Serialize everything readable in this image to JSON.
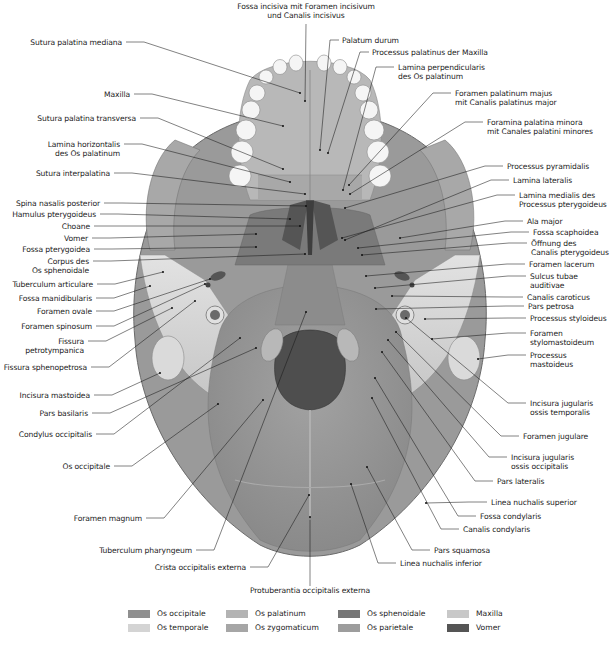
{
  "diagram": {
    "labels_left": [
      {
        "id": "sutura-palatina-mediana",
        "text": "Sutura palatina mediana",
        "x": 122,
        "y": 42,
        "ax": 300,
        "ay": 93
      },
      {
        "id": "maxilla",
        "text": "Maxilla",
        "x": 130,
        "y": 94,
        "ax": 283,
        "ay": 126
      },
      {
        "id": "sutura-palatina-transversa",
        "text": "Sutura palatina transversa",
        "x": 136,
        "y": 118,
        "ax": 283,
        "ay": 169
      },
      {
        "id": "lamina-horizontalis",
        "text": "Lamina horizontalis\ndes Os palatinum",
        "x": 120,
        "y": 144,
        "ax": 290,
        "ay": 182
      },
      {
        "id": "sutura-interpalatina",
        "text": "Sutura interpalatina",
        "x": 110,
        "y": 173,
        "ax": 305,
        "ay": 194
      },
      {
        "id": "spina-nasalis-posterior",
        "text": "Spina nasalis posterior",
        "x": 100,
        "y": 203,
        "ax": 306,
        "ay": 206
      },
      {
        "id": "hamulus-pterygoideus",
        "text": "Hamulus pterygoideus",
        "x": 96,
        "y": 214,
        "ax": 290,
        "ay": 219
      },
      {
        "id": "choane",
        "text": "Choane",
        "x": 90,
        "y": 226,
        "ax": 300,
        "ay": 226
      },
      {
        "id": "vomer",
        "text": "Vomer",
        "x": 88,
        "y": 238,
        "ax": 256,
        "ay": 234
      },
      {
        "id": "fossa-pterygoidea",
        "text": "Fossa pterygoidea",
        "x": 90,
        "y": 249,
        "ax": 256,
        "ay": 247
      },
      {
        "id": "corpus-des-os-sphenoidale",
        "text": "Corpus des\nOs sphenoidale",
        "x": 89,
        "y": 261,
        "ax": 305,
        "ay": 254
      },
      {
        "id": "tuberculum-articulare",
        "text": "Tuberculum articulare",
        "x": 93,
        "y": 284,
        "ax": 163,
        "ay": 272
      },
      {
        "id": "fossa-mandibularis",
        "text": "Fossa manidibularis",
        "x": 92,
        "y": 298,
        "ax": 150,
        "ay": 286
      },
      {
        "id": "foramen-ovale",
        "text": "Foramen ovale",
        "x": 92,
        "y": 311,
        "ax": 210,
        "ay": 279
      },
      {
        "id": "foramen-spinosum",
        "text": "Foramen spinosum",
        "x": 92,
        "y": 326,
        "ax": 205,
        "ay": 284
      },
      {
        "id": "fissura-petrotympanica",
        "text": "Fissura\npetrotympanica",
        "x": 84,
        "y": 341,
        "ax": 172,
        "ay": 308
      },
      {
        "id": "fissura-sphenopetrosa",
        "text": "Fissura sphenopetrosa",
        "x": 87,
        "y": 367,
        "ax": 195,
        "ay": 301
      },
      {
        "id": "incisura-mastoidea",
        "text": "Incisura mastoidea",
        "x": 90,
        "y": 395,
        "ax": 160,
        "ay": 373
      },
      {
        "id": "pars-basilaris",
        "text": "Pars basilaris",
        "x": 88,
        "y": 413,
        "ax": 256,
        "ay": 348
      },
      {
        "id": "condylus-occipitalis",
        "text": "Condylus occipitalis",
        "x": 92,
        "y": 434,
        "ax": 240,
        "ay": 338
      },
      {
        "id": "os-occipitale",
        "text": "Os occipitale",
        "x": 110,
        "y": 466,
        "ax": 218,
        "ay": 404
      },
      {
        "id": "foramen-magnum",
        "text": "Foramen magnum",
        "x": 142,
        "y": 518,
        "ax": 263,
        "ay": 400
      },
      {
        "id": "tuberculum-pharyngeum",
        "text": "Tuberculum pharyngeum",
        "x": 192,
        "y": 550,
        "ax": 306,
        "ay": 312
      },
      {
        "id": "crista-occipitalis-externa",
        "text": "Crista occipitalis externa",
        "x": 246,
        "y": 567,
        "ax": 309,
        "ay": 495
      }
    ],
    "labels_top": [
      {
        "id": "fossa-incisiva",
        "text": "Fossa incisiva mit Foramen incisivum\nund Canalis incisivus",
        "x": 306,
        "y": 6,
        "ax": 305,
        "ay": 101
      },
      {
        "id": "palatum-durum",
        "text": "Palatum durum",
        "x": 342,
        "y": 40,
        "ax": 320,
        "ay": 150
      },
      {
        "id": "processus-palatinus-maxilla",
        "text": "Processus palatinus der Maxilla",
        "x": 372,
        "y": 52,
        "ax": 328,
        "ay": 153
      }
    ],
    "labels_right": [
      {
        "id": "lamina-perpendicularis",
        "text": "Lamina perpendicularis\ndes Os palatinum",
        "x": 398,
        "y": 67,
        "ax": 343,
        "ay": 190
      },
      {
        "id": "foramen-palatinum-majus",
        "text": "Foramen palatinum majus\nmit Canalis palatinus major",
        "x": 455,
        "y": 93,
        "ax": 349,
        "ay": 185
      },
      {
        "id": "foramina-palatina-minora",
        "text": "Foramina palatina minora\nmit Canales palatini minores",
        "x": 487,
        "y": 122,
        "ax": 350,
        "ay": 194
      },
      {
        "id": "processus-pyramidalis",
        "text": "Processus pyramidalis",
        "x": 507,
        "y": 166,
        "ax": 345,
        "ay": 208
      },
      {
        "id": "lamina-lateralis",
        "text": "Lamina lateralis",
        "x": 513,
        "y": 180,
        "ax": 345,
        "ay": 240
      },
      {
        "id": "lamina-medialis",
        "text": "Lamina medialis des\nProcessus pterygoideus",
        "x": 519,
        "y": 195,
        "ax": 342,
        "ay": 238
      },
      {
        "id": "ala-major",
        "text": "Ala major",
        "x": 527,
        "y": 221,
        "ax": 400,
        "ay": 238
      },
      {
        "id": "fossa-scaphoidea",
        "text": "Fossa scaphoidea",
        "x": 533,
        "y": 232,
        "ax": 358,
        "ay": 248
      },
      {
        "id": "oeffnung-canalis-pterygoideus",
        "text": "Öffnung des\nCanalis pterygoideus",
        "x": 531,
        "y": 243,
        "ax": 362,
        "ay": 255
      },
      {
        "id": "foramen-lacerum",
        "text": "Foramen lacerum",
        "x": 529,
        "y": 264,
        "ax": 366,
        "ay": 276
      },
      {
        "id": "sulcus-tubae-auditivae",
        "text": "Sulcus tubae\nauditivae",
        "x": 530,
        "y": 276,
        "ax": 375,
        "ay": 288
      },
      {
        "id": "canalis-caroticus",
        "text": "Canalis caroticus",
        "x": 527,
        "y": 297,
        "ax": 392,
        "ay": 296
      },
      {
        "id": "pars-petrosa",
        "text": "Pars petrosa",
        "x": 528,
        "y": 306,
        "ax": 376,
        "ay": 309
      },
      {
        "id": "processus-styloideus",
        "text": "Processus styloideus",
        "x": 530,
        "y": 318,
        "ax": 425,
        "ay": 319
      },
      {
        "id": "foramen-stylomastoideum",
        "text": "Foramen\nstylomastoideum",
        "x": 530,
        "y": 333,
        "ax": 432,
        "ay": 339
      },
      {
        "id": "processus-mastoideus",
        "text": "Processus\nmastoideus",
        "x": 530,
        "y": 355,
        "ax": 478,
        "ay": 359
      },
      {
        "id": "incisura-jugularis-ossis-temporalis",
        "text": "Incisura jugularis\nossis temporalis",
        "x": 530,
        "y": 403,
        "ax": 406,
        "ay": 318
      },
      {
        "id": "foramen-jugulare",
        "text": "Foramen jugulare",
        "x": 523,
        "y": 436,
        "ax": 396,
        "ay": 332
      },
      {
        "id": "incisura-jugularis-ossis-occipitalis",
        "text": "Incisura jugularis\nossis occipitalis",
        "x": 511,
        "y": 457,
        "ax": 388,
        "ay": 340
      },
      {
        "id": "pars-lateralis",
        "text": "Pars lateralis",
        "x": 497,
        "y": 481,
        "ax": 382,
        "ay": 352
      },
      {
        "id": "linea-nuchalis-superior",
        "text": "Linea nuchalis superior",
        "x": 491,
        "y": 502,
        "ax": 426,
        "ay": 503
      },
      {
        "id": "fossa-condylaris",
        "text": "Fossa condylaris",
        "x": 480,
        "y": 516,
        "ax": 375,
        "ay": 378
      },
      {
        "id": "canalis-condylaris",
        "text": "Canalis condylaris",
        "x": 463,
        "y": 529,
        "ax": 372,
        "ay": 398
      },
      {
        "id": "pars-squamosa",
        "text": "Pars squamosa",
        "x": 434,
        "y": 550,
        "ax": 367,
        "ay": 467
      },
      {
        "id": "linea-nuchalis-inferior",
        "text": "Linea nuchalis inferior",
        "x": 400,
        "y": 563,
        "ax": 351,
        "ay": 484
      }
    ],
    "labels_bottom": [
      {
        "id": "protuberantia-occipitalis-externa",
        "text": "Protuberantia occipitalis externa",
        "x": 310,
        "y": 590,
        "ax": 310,
        "ay": 517
      }
    ]
  },
  "legend": {
    "items": [
      {
        "label": "Os occipitale",
        "color": "#8f8f8f",
        "x": 128,
        "y": 613
      },
      {
        "label": "Os temporale",
        "color": "#d4d4d4",
        "x": 128,
        "y": 627
      },
      {
        "label": "Os palatinum",
        "color": "#b3b3b3",
        "x": 226,
        "y": 613
      },
      {
        "label": "Os zygomaticum",
        "color": "#a6a6a6",
        "x": 226,
        "y": 627
      },
      {
        "label": "Os sphenoidale",
        "color": "#767676",
        "x": 338,
        "y": 613
      },
      {
        "label": "Os parietale",
        "color": "#9d9d9d",
        "x": 338,
        "y": 627
      },
      {
        "label": "Maxilla",
        "color": "#c8c8c8",
        "x": 447,
        "y": 613
      },
      {
        "label": "Vomer",
        "color": "#555555",
        "x": 447,
        "y": 627
      }
    ]
  }
}
